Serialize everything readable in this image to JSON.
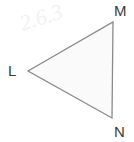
{
  "figure": {
    "type": "geometry-triangle",
    "background_color": "#ffffff",
    "stroke_color": "#8a8a8a",
    "fill_color": "#fafafa",
    "label_color": "#3b3b3b",
    "watermark_text": "2.6.3",
    "vertices": [
      {
        "id": "L",
        "label": "L",
        "x": 28,
        "y": 71
      },
      {
        "id": "M",
        "label": "M",
        "x": 113,
        "y": 22
      },
      {
        "id": "N",
        "label": "N",
        "x": 112,
        "y": 118
      }
    ],
    "edges": [
      {
        "from": "L",
        "to": "M"
      },
      {
        "from": "M",
        "to": "N"
      },
      {
        "from": "N",
        "to": "L"
      }
    ],
    "polygon_points": "28,71 113,22 112,118"
  }
}
